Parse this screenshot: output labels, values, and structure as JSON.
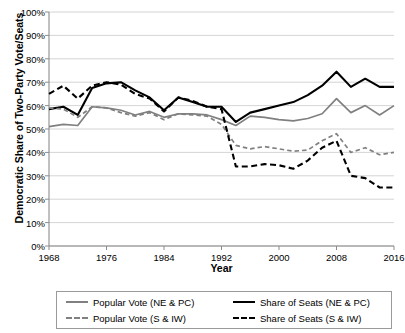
{
  "chart_data": {
    "type": "line",
    "title": "",
    "xlabel": "Year",
    "ylabel": "Democratic Share of Two-Party Vote/Seats",
    "xlim": [
      1968,
      2016
    ],
    "ylim": [
      0,
      100
    ],
    "grid": true,
    "legend_position": "bottom",
    "y_ticks": [
      "0%",
      "10%",
      "20%",
      "30%",
      "40%",
      "50%",
      "60%",
      "70%",
      "80%",
      "90%",
      "100%"
    ],
    "x_ticks": [
      "1968",
      "1976",
      "1984",
      "1992",
      "2000",
      "2008",
      "2016"
    ],
    "x": [
      1968,
      1970,
      1972,
      1974,
      1976,
      1978,
      1980,
      1982,
      1984,
      1986,
      1988,
      1990,
      1992,
      1994,
      1996,
      1998,
      2000,
      2002,
      2004,
      2006,
      2008,
      2010,
      2012,
      2014,
      2016
    ],
    "series": [
      {
        "name": "Popular Vote (NE & PC)",
        "color": "#808080",
        "style": "solid",
        "values": [
          51,
          52,
          51.5,
          59.5,
          59,
          58,
          56,
          57.5,
          55,
          56.5,
          56.5,
          56,
          54,
          51.5,
          55.5,
          55,
          54,
          53.5,
          54.5,
          56.5,
          63,
          57,
          60,
          56,
          60
        ]
      },
      {
        "name": "Share of Seats (NE & PC)",
        "color": "#000000",
        "style": "solid",
        "values": [
          58.5,
          59.5,
          56,
          67.5,
          69.5,
          70,
          66.5,
          63.5,
          58,
          63.5,
          61.5,
          59.5,
          59.5,
          53,
          57,
          58.5,
          60,
          61.5,
          64.5,
          68.5,
          74.5,
          68,
          71.5,
          68,
          68
        ]
      },
      {
        "name": "Popular Vote (S & IW)",
        "color": "#808080",
        "style": "dashed",
        "values": [
          59,
          58.5,
          55,
          59.5,
          59,
          57,
          55.5,
          57,
          54,
          56.5,
          56,
          55.5,
          52,
          43,
          41.5,
          42.5,
          41.5,
          40.5,
          41,
          45,
          48,
          40,
          42,
          39,
          40
        ]
      },
      {
        "name": "Share of Seats (S & IW)",
        "color": "#000000",
        "style": "dashed",
        "values": [
          65,
          68.5,
          63,
          68.5,
          70,
          69,
          65,
          63,
          57.5,
          63.5,
          62,
          59.5,
          58.5,
          34,
          34,
          35,
          34.5,
          33,
          36.5,
          42,
          45,
          30,
          29,
          25,
          25
        ]
      }
    ]
  }
}
